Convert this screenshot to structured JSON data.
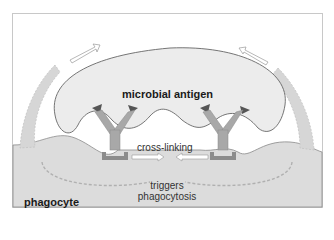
{
  "diagram": {
    "labels": {
      "microbial_antigen": "microbial antigen",
      "cross_linking": "cross-linking",
      "triggers_line1": "triggers",
      "triggers_line2": "phagocytosis",
      "phagocyte": "phagocyte"
    },
    "colors": {
      "microbe_fill": "#ececec",
      "phagocyte_fill": "#dcdcdc",
      "antibody": "#a8a8a8",
      "antigen": "#555555",
      "receptor": "#8c8c8c",
      "pseudopod": "#d6d6d6",
      "arrow_dashed": "#b0b0b0"
    }
  }
}
